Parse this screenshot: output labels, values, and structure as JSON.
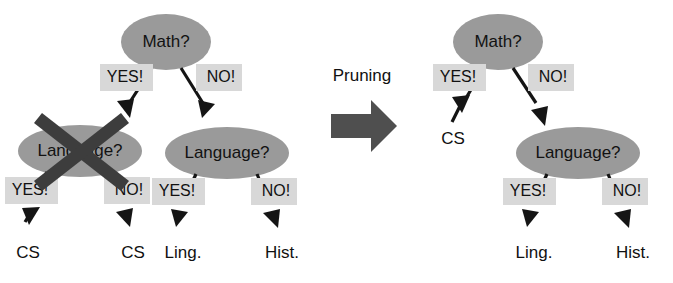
{
  "figure": {
    "background_color": "#ffffff",
    "node_fill_color": "#9a9a9a",
    "tag_fill_color": "#d8d8d8",
    "edge_color": "#151515",
    "x_mark_color": "#3d3d3d",
    "block_arrow_color": "#4f4f4f"
  },
  "transition": {
    "label": "Pruning",
    "arrow_icon": "block-arrow-right-icon",
    "direction": "right"
  },
  "before_tree": {
    "caption": "Unpruned decision tree",
    "nodes": [
      {
        "id": "root",
        "label": "Math?",
        "type": "decision"
      },
      {
        "id": "left_lang",
        "label": "Language?",
        "type": "decision",
        "pruned": "true"
      },
      {
        "id": "right_lang",
        "label": "Language?",
        "type": "decision"
      }
    ],
    "leaves": [
      {
        "id": "l1",
        "label": "CS"
      },
      {
        "id": "l2",
        "label": "CS"
      },
      {
        "id": "l3",
        "label": "Ling."
      },
      {
        "id": "l4",
        "label": "Hist."
      }
    ],
    "edges": [
      {
        "from": "root",
        "to": "left_lang",
        "label": "YES!"
      },
      {
        "from": "root",
        "to": "right_lang",
        "label": "NO!"
      },
      {
        "from": "left_lang",
        "to": "l1",
        "label": "YES!"
      },
      {
        "from": "left_lang",
        "to": "l2",
        "label": "NO!"
      },
      {
        "from": "right_lang",
        "to": "l3",
        "label": "YES!"
      },
      {
        "from": "right_lang",
        "to": "l4",
        "label": "NO!"
      }
    ],
    "pruned_marker": "x-cross-icon"
  },
  "after_tree": {
    "caption": "Pruned decision tree",
    "nodes": [
      {
        "id": "root",
        "label": "Math?",
        "type": "decision"
      },
      {
        "id": "lang",
        "label": "Language?",
        "type": "decision"
      }
    ],
    "leaves": [
      {
        "id": "l1",
        "label": "CS"
      },
      {
        "id": "l2",
        "label": "Ling."
      },
      {
        "id": "l3",
        "label": "Hist."
      }
    ],
    "edges": [
      {
        "from": "root",
        "to": "l1",
        "label": "YES!"
      },
      {
        "from": "root",
        "to": "lang",
        "label": "NO!"
      },
      {
        "from": "lang",
        "to": "l2",
        "label": "YES!"
      },
      {
        "from": "lang",
        "to": "l3",
        "label": "NO!"
      }
    ]
  }
}
